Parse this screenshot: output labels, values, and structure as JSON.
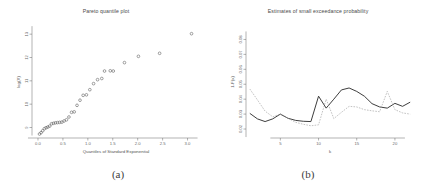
{
  "figure": {
    "captions": [
      {
        "id": "a",
        "text": "(a)"
      },
      {
        "id": "b",
        "text": "(b)"
      }
    ]
  },
  "panel_a": {
    "title": "Pareto quantile plot",
    "xlabel": "Quantiles of Standard Exponential",
    "ylabel": "log(X)"
  },
  "panel_b": {
    "title": "Estimates of small exceedance probability",
    "xlabel": "k",
    "ylabel": "1-F(x)"
  },
  "colors": {
    "point": "#555555",
    "solid_line": "#333333",
    "dashed_line": "#999999",
    "axis": "#666666",
    "text": "#4a4a4a",
    "background": "#ffffff"
  },
  "chart_data": [
    {
      "type": "scatter",
      "title": "Pareto quantile plot",
      "xlabel": "Quantiles of Standard Exponential",
      "ylabel": "log(X)",
      "xlim": [
        -0.12,
        3.25
      ],
      "ylim": [
        8.55,
        13.35
      ],
      "xticks": [
        0.0,
        0.5,
        1.0,
        1.5,
        2.0,
        2.5,
        3.0
      ],
      "xticklabels": [
        "0.0",
        "0.5",
        "1.0",
        "1.5",
        "2.0",
        "2.5",
        "3.0"
      ],
      "yticks": [
        9,
        10,
        11,
        12,
        13
      ],
      "yticklabels": [
        "9",
        "10",
        "11",
        "12",
        "13"
      ],
      "grid": false,
      "legend": "none",
      "marker": "open-circle",
      "points": [
        {
          "x": 0.03,
          "y": 8.72
        },
        {
          "x": 0.062,
          "y": 8.78
        },
        {
          "x": 0.095,
          "y": 8.86
        },
        {
          "x": 0.128,
          "y": 8.95
        },
        {
          "x": 0.163,
          "y": 8.99
        },
        {
          "x": 0.198,
          "y": 9.02
        },
        {
          "x": 0.235,
          "y": 9.06
        },
        {
          "x": 0.272,
          "y": 9.16
        },
        {
          "x": 0.311,
          "y": 9.18
        },
        {
          "x": 0.351,
          "y": 9.2
        },
        {
          "x": 0.392,
          "y": 9.21
        },
        {
          "x": 0.435,
          "y": 9.22
        },
        {
          "x": 0.479,
          "y": 9.23
        },
        {
          "x": 0.524,
          "y": 9.28
        },
        {
          "x": 0.572,
          "y": 9.33
        },
        {
          "x": 0.621,
          "y": 9.45
        },
        {
          "x": 0.673,
          "y": 9.65
        },
        {
          "x": 0.727,
          "y": 9.67
        },
        {
          "x": 0.783,
          "y": 9.95
        },
        {
          "x": 0.843,
          "y": 10.17
        },
        {
          "x": 0.906,
          "y": 10.38
        },
        {
          "x": 0.972,
          "y": 10.4
        },
        {
          "x": 1.04,
          "y": 10.62
        },
        {
          "x": 1.115,
          "y": 10.88
        },
        {
          "x": 1.195,
          "y": 11.05
        },
        {
          "x": 1.28,
          "y": 11.1
        },
        {
          "x": 1.335,
          "y": 11.42
        },
        {
          "x": 1.45,
          "y": 11.43
        },
        {
          "x": 1.51,
          "y": 11.42
        },
        {
          "x": 1.735,
          "y": 11.78
        },
        {
          "x": 2.015,
          "y": 12.05
        },
        {
          "x": 2.44,
          "y": 12.18
        },
        {
          "x": 3.08,
          "y": 13.02
        }
      ]
    },
    {
      "type": "line",
      "title": "Estimates of small exceedance probability",
      "xlabel": "k",
      "ylabel": "1-F(x)",
      "xlim": [
        0.5,
        22.5
      ],
      "ylim": [
        0.014,
        0.089
      ],
      "xticks": [
        5,
        10,
        15,
        20
      ],
      "xticklabels": [
        "5",
        "10",
        "15",
        "20"
      ],
      "yticks": [
        0.02,
        0.03,
        0.04,
        0.05,
        0.06,
        0.07,
        0.08
      ],
      "yticklabels": [
        "0.02",
        "0.03",
        "0.04",
        "0.05",
        "0.06",
        "0.07",
        "0.08"
      ],
      "grid": false,
      "legend": "none",
      "x": [
        1,
        2,
        3,
        4,
        5,
        6,
        7,
        8,
        9,
        10,
        11,
        12,
        13,
        14,
        15,
        16,
        17,
        18,
        19,
        20,
        21,
        22
      ],
      "series": [
        {
          "name": "solid",
          "style": "solid",
          "values": [
            0.0305,
            0.0268,
            0.025,
            0.0268,
            0.03,
            0.0272,
            0.0258,
            0.0252,
            0.025,
            0.042,
            0.034,
            0.04,
            0.0462,
            0.0475,
            0.0452,
            0.042,
            0.037,
            0.0348,
            0.034,
            0.0372,
            0.0352,
            0.038
          ]
        },
        {
          "name": "dashed",
          "style": "dashed",
          "values": [
            0.0468,
            0.0395,
            0.032,
            0.0282,
            0.03,
            0.0272,
            0.0245,
            0.0232,
            0.0222,
            0.0228,
            0.04,
            0.027,
            0.0312,
            0.0352,
            0.0348,
            0.033,
            0.0322,
            0.0316,
            0.0452,
            0.033,
            0.0308,
            0.03
          ]
        }
      ]
    }
  ]
}
